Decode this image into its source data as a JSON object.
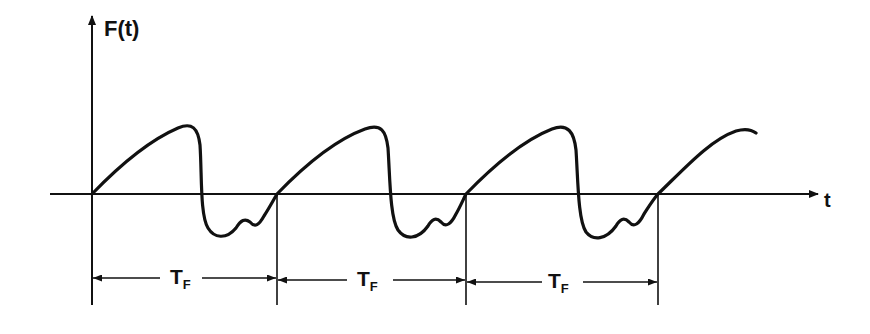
{
  "diagram": {
    "type": "periodic-waveform",
    "y_axis_label": "F(t)",
    "x_axis_label": "t",
    "period_label": {
      "main": "T",
      "subscript": "F"
    },
    "periods": [
      {
        "label_main": "T",
        "label_sub": "F",
        "start_x": 92,
        "end_x": 277
      },
      {
        "label_main": "T",
        "label_sub": "F",
        "start_x": 277,
        "end_x": 466
      },
      {
        "label_main": "T",
        "label_sub": "F",
        "start_x": 466,
        "end_x": 658
      }
    ],
    "colors": {
      "line": "#111111",
      "background": "#ffffff"
    }
  }
}
